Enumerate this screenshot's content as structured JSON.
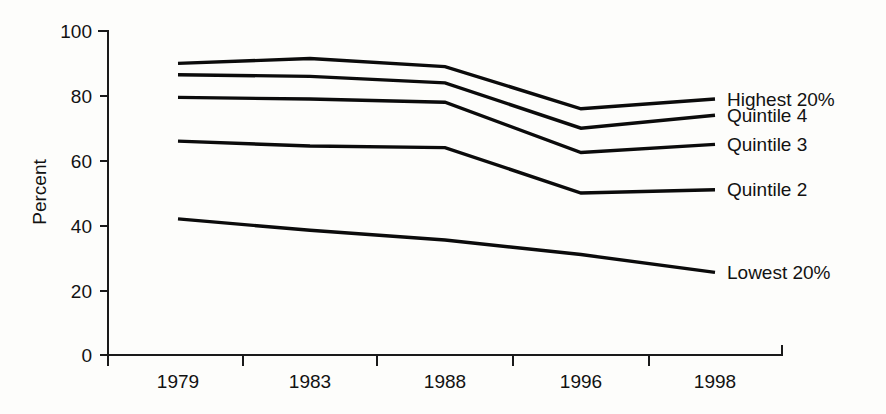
{
  "chart_data": {
    "type": "line",
    "title": "",
    "xlabel": "",
    "ylabel": "Percent",
    "categories": [
      "1979",
      "1983",
      "1988",
      "1996",
      "1998"
    ],
    "ylim": [
      0,
      100
    ],
    "yticks": [
      0,
      20,
      40,
      60,
      80,
      100
    ],
    "grid": false,
    "legend_position": "right-inline",
    "series": [
      {
        "name": "Highest 20%",
        "values": [
          90,
          91.5,
          89,
          76,
          79
        ]
      },
      {
        "name": "Quintile 4",
        "values": [
          86.5,
          86,
          84,
          70,
          74
        ]
      },
      {
        "name": "Quintile 3",
        "values": [
          79.5,
          79,
          78,
          62.5,
          65
        ]
      },
      {
        "name": "Quintile 2",
        "values": [
          66,
          64.5,
          64,
          50,
          51
        ]
      },
      {
        "name": "Lowest 20%",
        "values": [
          42,
          38.5,
          35.5,
          31,
          25.5
        ]
      }
    ],
    "colors": {
      "line": "#0b0b0b",
      "axis": "#1a1a1a",
      "text": "#121212",
      "background": "#fdfdfb"
    }
  },
  "axis": {
    "y_title": "Percent",
    "y_tick_labels": [
      "100",
      "80",
      "60",
      "40",
      "20",
      "0"
    ],
    "x_tick_labels": [
      "1979",
      "1983",
      "1988",
      "1996",
      "1998"
    ]
  },
  "legend": {
    "items": [
      {
        "label": "Highest 20%"
      },
      {
        "label": "Quintile 4"
      },
      {
        "label": "Quintile 3"
      },
      {
        "label": "Quintile 2"
      },
      {
        "label": "Lowest 20%"
      }
    ]
  }
}
